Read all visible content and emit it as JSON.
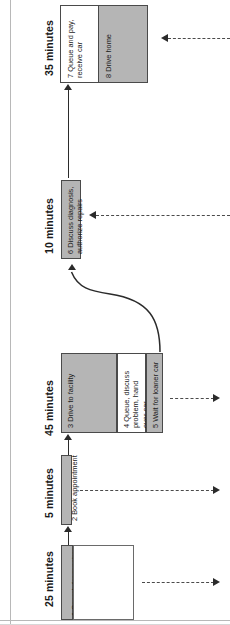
{
  "diagram": {
    "orientation": "rotated-90-ccw",
    "phases": [
      {
        "id": "p35",
        "label": "35 minutes"
      },
      {
        "id": "p10",
        "label": "10 minutes"
      },
      {
        "id": "p45",
        "label": "45 minutes"
      },
      {
        "id": "p5",
        "label": "5 minutes"
      },
      {
        "id": "p25",
        "label": "25 minutes"
      }
    ],
    "steps": [
      {
        "id": "s1",
        "number": "1",
        "label": "1 Search for repairer",
        "fill": "gray"
      },
      {
        "id": "s2",
        "number": "2",
        "label": "2 Book appointment",
        "fill": "gray"
      },
      {
        "id": "s3",
        "number": "3",
        "label": "3 Drive to facility",
        "fill": "gray"
      },
      {
        "id": "s4",
        "number": "4",
        "label": "4 Queue, discuss\nproblem, hand\nover car",
        "fill": "white"
      },
      {
        "id": "s5",
        "number": "5",
        "label": "5 Wait for loaner car",
        "fill": "gray"
      },
      {
        "id": "s6",
        "number": "6",
        "label": "6 Discuss diagnosis,\nauthorize repairs",
        "fill": "gray"
      },
      {
        "id": "s7",
        "number": "7",
        "label": "7 Queue and pay,\nreceive car",
        "fill": "white"
      },
      {
        "id": "s8",
        "number": "8",
        "label": "8 Drive home",
        "fill": "gray"
      }
    ],
    "colors": {
      "fill_gray": "#b5b5b5",
      "fill_white": "#ffffff",
      "stroke": "#4a4a4a",
      "arrow": "#2b2b2b",
      "frame": "#b8b8b8"
    }
  }
}
